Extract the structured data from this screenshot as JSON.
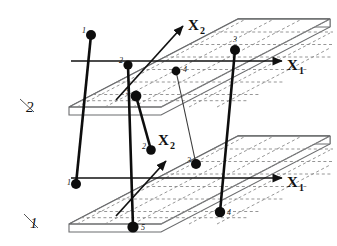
{
  "figure": {
    "type": "two-layer-multiplex-network-diagram",
    "layer_count": 2,
    "node_count_per_layer": 5
  },
  "layers": [
    {
      "id": "upper",
      "plane_label": "2",
      "plane_label_pos": {
        "x": 27,
        "y": 108
      },
      "axes": {
        "x1": {
          "label": "X",
          "sub": "1",
          "label_pos": {
            "x": 289,
            "y": 69
          }
        },
        "x2": {
          "label": "X",
          "sub": "2",
          "label_pos": {
            "x": 193,
            "y": 31
          }
        }
      },
      "nodes": [
        {
          "id": "1",
          "cx": 91,
          "cy": 35,
          "r": 5.0,
          "label_dx": -9,
          "label_dy": -2
        },
        {
          "id": "2",
          "cx": 128,
          "cy": 65,
          "r": 4.6,
          "label_dx": -9,
          "label_dy": -2
        },
        {
          "id": "3",
          "cx": 235,
          "cy": 50,
          "r": 5.0,
          "label_dx": -2,
          "label_dy": -8
        },
        {
          "id": "4",
          "cx": 176,
          "cy": 71,
          "r": 4.4,
          "label_dx": 7,
          "label_dy": 1
        },
        {
          "id": "5",
          "cx": 136,
          "cy": 96,
          "r": 5.4,
          "label_dx": -10,
          "label_dy": -2
        }
      ]
    },
    {
      "id": "lower",
      "plane_label": "1",
      "plane_label_pos": {
        "x": 31,
        "y": 222
      },
      "axes": {
        "x1": {
          "label": "X",
          "sub": "1",
          "label_pos": {
            "x": 289,
            "y": 186
          }
        },
        "x2": {
          "label": "X",
          "sub": "2",
          "label_pos": {
            "x": 165,
            "y": 146
          }
        }
      },
      "nodes": [
        {
          "id": "1",
          "cx": 76,
          "cy": 184,
          "r": 5.0,
          "label_dx": -9,
          "label_dy": 1
        },
        {
          "id": "2",
          "cx": 151,
          "cy": 150,
          "r": 4.8,
          "label_dx": -9,
          "label_dy": -1
        },
        {
          "id": "3",
          "cx": 196,
          "cy": 164,
          "r": 5.0,
          "label_dx": -9,
          "label_dy": -1
        },
        {
          "id": "4",
          "cx": 220,
          "cy": 212,
          "r": 5.2,
          "label_dx": 7,
          "label_dy": 3
        },
        {
          "id": "5",
          "cx": 133,
          "cy": 227,
          "r": 5.6,
          "label_dx": 8,
          "label_dy": 3
        }
      ]
    }
  ],
  "interlayer_links": [
    {
      "from": "upper-1",
      "to": "lower-1",
      "style": "thick"
    },
    {
      "from": "upper-2",
      "to": "lower-5",
      "style": "thick"
    },
    {
      "from": "upper-5",
      "to": "lower-2",
      "style": "thick"
    },
    {
      "from": "upper-3",
      "to": "lower-4",
      "style": "thick"
    },
    {
      "from": "upper-4",
      "to": "lower-3",
      "style": "thin"
    }
  ],
  "colors": {
    "ink": "#1a1a1a",
    "node_fill": "#0d0d0d",
    "plane_stroke": "#58595b",
    "grid_dash": "#808080",
    "background": "#ffffff"
  },
  "grid": {
    "style": "dashed",
    "rows": 7,
    "cols": 6
  }
}
